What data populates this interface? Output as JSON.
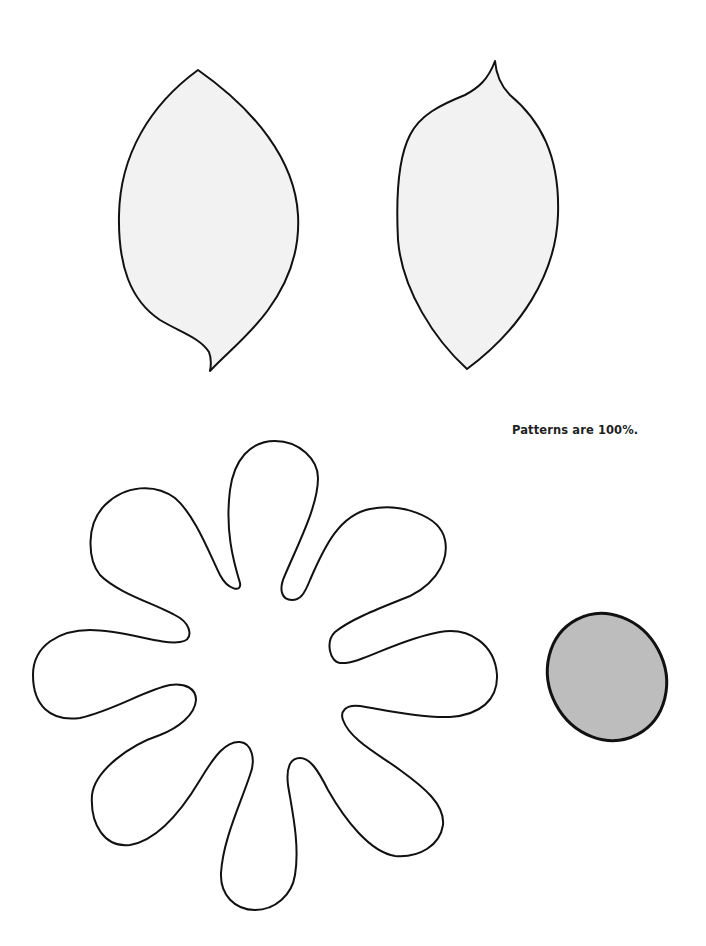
{
  "page": {
    "caption": "Patterns are 100%.",
    "colors": {
      "background": "#ffffff",
      "outline": "#111111",
      "leaf_fill": "#f2f2f2",
      "center_fill": "#bdbdbd",
      "flower_fill": "#ffffff"
    }
  },
  "patterns": [
    {
      "name": "leaf-left",
      "shape": "leaf with curled stem tip at bottom"
    },
    {
      "name": "leaf-right",
      "shape": "leaf with curled tip at top"
    },
    {
      "name": "flower-eight-petal",
      "shape": "eight rounded petals"
    },
    {
      "name": "flower-center",
      "shape": "gray oval"
    }
  ]
}
